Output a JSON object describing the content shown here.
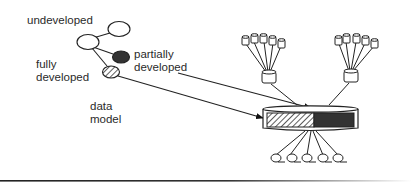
{
  "labels": {
    "undeveloped": "undeveloped",
    "partially_line1": "partially",
    "partially_line2": "developed",
    "fully_line1": "fully",
    "fully_line2": "developed",
    "model_line1": "data",
    "model_line2": "model"
  },
  "colors": {
    "stroke": "#222222",
    "dark_fill": "#333333",
    "background": "#ffffff"
  },
  "diagram": {
    "tree_nodes": [
      {
        "id": "root",
        "state": "undeveloped"
      },
      {
        "id": "child-top",
        "state": "undeveloped"
      },
      {
        "id": "child-partial",
        "state": "partially developed"
      },
      {
        "id": "child-full",
        "state": "fully developed"
      }
    ],
    "storage_clusters": [
      {
        "id": "left-cluster",
        "leaf_count": 5
      },
      {
        "id": "right-cluster",
        "leaf_count": 5
      }
    ],
    "database_segments": [
      "fully developed (hatched)",
      "partially developed (dark)"
    ],
    "client_nodes_count": 5
  }
}
